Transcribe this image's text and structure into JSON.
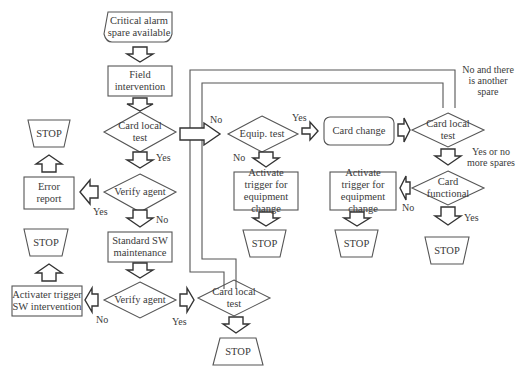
{
  "diagram": {
    "type": "flowchart",
    "nodes": {
      "start": {
        "shape": "terminal",
        "label": "Critical alarm spare available"
      },
      "field": {
        "shape": "process",
        "label": "Field intervention"
      },
      "card_test_1": {
        "shape": "decision",
        "label": "Card local test"
      },
      "verify_1": {
        "shape": "decision",
        "label": "Verify agent"
      },
      "error_report": {
        "shape": "process",
        "label": "Error report"
      },
      "stop_error": {
        "shape": "stop",
        "label": "STOP"
      },
      "std_sw": {
        "shape": "process",
        "label": "Standard SW maintenance"
      },
      "verify_2": {
        "shape": "decision",
        "label": "Verify agent"
      },
      "act_sw": {
        "shape": "process",
        "label": "Activater trigger SW intervention"
      },
      "stop_sw": {
        "shape": "stop",
        "label": "STOP"
      },
      "card_test_3": {
        "shape": "decision",
        "label": "Card local test"
      },
      "stop_bottom": {
        "shape": "stop",
        "label": "STOP"
      },
      "equip_test": {
        "shape": "decision",
        "label": "Equip. test"
      },
      "act_equip_1": {
        "shape": "process",
        "label": "Activate trigger for equipment change"
      },
      "stop_equip_1": {
        "shape": "stop",
        "label": "STOP"
      },
      "card_change": {
        "shape": "rounded",
        "label": "Card change"
      },
      "card_test_2": {
        "shape": "decision",
        "label": "Card local test"
      },
      "card_functional": {
        "shape": "decision",
        "label": "Card functional"
      },
      "act_equip_2": {
        "shape": "process",
        "label": "Activate trigger for equipment change"
      },
      "stop_equip_2": {
        "shape": "stop",
        "label": "STOP"
      },
      "stop_functional": {
        "shape": "stop",
        "label": "STOP"
      }
    },
    "edge_labels": {
      "card1_no": "No",
      "card1_yes": "Yes",
      "verify1_yes": "Yes",
      "verify1_no": "No",
      "verify2_no": "No",
      "verify2_yes": "Yes",
      "equip_yes": "Yes",
      "equip_no": "No",
      "card2_loop": "No and there is another spare",
      "card2_yes": "Yes or no more spares",
      "functional_no": "No",
      "functional_yes": "Yes"
    }
  }
}
